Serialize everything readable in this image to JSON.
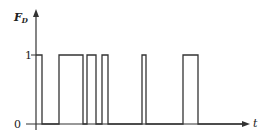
{
  "chart_data": {
    "type": "line",
    "title": "",
    "xlabel": "t",
    "ylabel": "F_D",
    "ylabel_main": "F",
    "ylabel_sub": "D",
    "yticks": [
      "0",
      "1"
    ],
    "ylim": [
      0,
      1
    ],
    "grid": false,
    "legend": null,
    "pulses": [
      {
        "start": 0,
        "end": 6
      },
      {
        "start": 23,
        "end": 47
      },
      {
        "start": 51,
        "end": 60
      },
      {
        "start": 66,
        "end": 72
      },
      {
        "start": 106,
        "end": 110
      },
      {
        "start": 147,
        "end": 162
      }
    ],
    "x_extent": [
      0,
      211
    ]
  },
  "colors": {
    "line": "#333333",
    "background": "#ffffff"
  }
}
